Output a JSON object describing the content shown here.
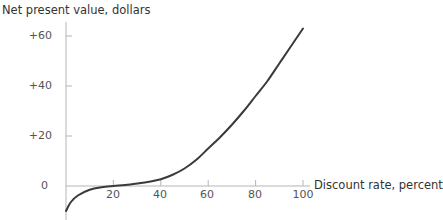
{
  "chart_data": {
    "type": "line",
    "title": "",
    "xlabel": "Discount rate, percent",
    "ylabel": "Net present value, dollars",
    "x_ticks": [
      20,
      40,
      60,
      80,
      100
    ],
    "x_tick_labels": [
      "20",
      "40",
      "60",
      "80",
      "100"
    ],
    "y_ticks": [
      0,
      20,
      40,
      60
    ],
    "y_tick_labels": [
      "0",
      "+20",
      "+40",
      "+60"
    ],
    "xlim": [
      0,
      100
    ],
    "ylim": [
      -10,
      65
    ],
    "grid": false,
    "legend": null,
    "series": [
      {
        "name": "Net present value",
        "x": [
          0,
          2,
          5,
          10,
          15,
          20,
          25,
          30,
          35,
          40,
          45,
          50,
          55,
          60,
          65,
          70,
          75,
          80,
          85,
          90,
          95,
          100
        ],
        "y": [
          -10,
          -6.5,
          -3.8,
          -1.5,
          -0.5,
          0,
          0.4,
          1,
          1.7,
          2.7,
          4.5,
          7,
          10.5,
          15,
          19.5,
          24.5,
          30,
          36,
          42,
          49,
          56,
          63
        ]
      }
    ],
    "line_color": "#3a3a3a",
    "axis_color": "#b5b5b5"
  }
}
